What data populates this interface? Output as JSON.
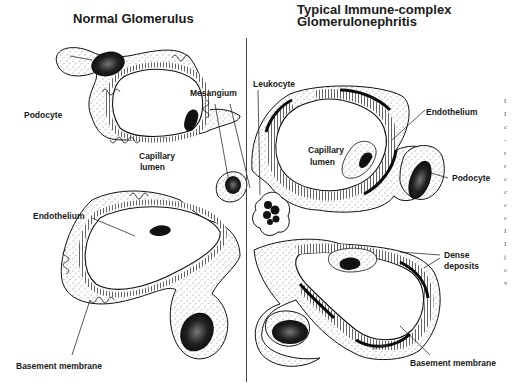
{
  "panels": {
    "left": {
      "title": "Normal Glomerulus",
      "labels": {
        "podocyte": "Podocyte",
        "mesangium": "Mesangium",
        "capillary_lumen_1": "Capillary",
        "capillary_lumen_2": "lumen",
        "endothelium": "Endothelium",
        "basement_membrane": "Basement membrane"
      }
    },
    "right": {
      "title_line1": "Typical Immune-complex",
      "title_line2": "Glomerulonephritis",
      "labels": {
        "leukocyte": "Leukocyte",
        "endothelium": "Endothelium",
        "capillary_lumen_1": "Capillary",
        "capillary_lumen_2": "lumen",
        "podocyte": "Podocyte",
        "dense_deposits_1": "Dense",
        "dense_deposits_2": "deposits",
        "basement_membrane": "Basement membrane"
      }
    }
  },
  "cropped_edge_text": [
    "I",
    "I",
    "c",
    "-",
    "r",
    "r",
    "c",
    "c",
    "c",
    "c",
    "I",
    "I",
    "j",
    "c",
    "v"
  ],
  "colors": {
    "ink": "#1a1a1a",
    "background": "#ffffff",
    "stipple": "#888888"
  }
}
